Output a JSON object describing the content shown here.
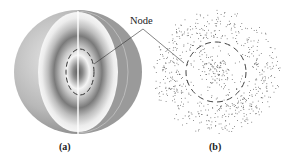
{
  "figure": {
    "panels": [
      {
        "id": "a",
        "label": "(a)",
        "description": "cutaway sphere with concentric shaded probability shells"
      },
      {
        "id": "b",
        "label": "(b)",
        "description": "dot-density cross-section of probability distribution"
      }
    ],
    "annotation": {
      "label": "Node"
    },
    "colors": {
      "dot": "#555555",
      "sphere_dark": "#8a8a8a",
      "sphere_light": "#f2f2f2",
      "dash": "#333333"
    }
  }
}
